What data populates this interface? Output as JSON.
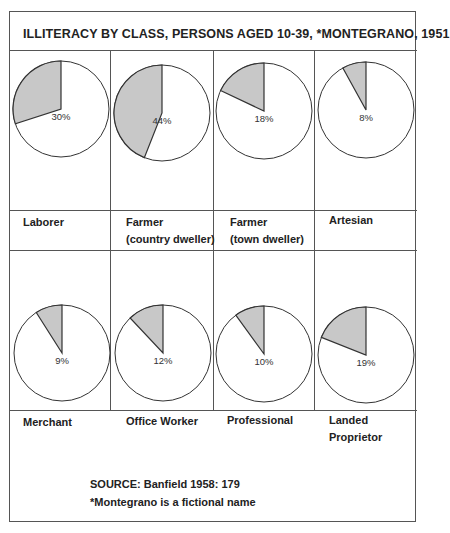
{
  "title": "ILLITERACY BY CLASS, PERSONS AGED 10-39, *MONTEGRANO, 1951",
  "colors": {
    "slice": "#c8c8c8",
    "stroke": "#333333",
    "background": "#ffffff"
  },
  "chart_data": {
    "type": "pie",
    "title": "ILLITERACY BY CLASS, PERSONS AGED 10-39, *MONTEGRANO, 1951",
    "note": "Each pie shows the percentage of illiterate persons (shaded) for one class",
    "categories": [
      "Laborer",
      "Farmer (country dweller)",
      "Farmer (town dweller)",
      "Artesian",
      "Merchant",
      "Office Worker",
      "Professional",
      "Landed Proprietor"
    ],
    "values": [
      30,
      44,
      18,
      8,
      9,
      12,
      10,
      19
    ],
    "unit": "%"
  },
  "panels": [
    {
      "label1": "Laborer",
      "label2": "",
      "pct_label": "30%",
      "value": 30
    },
    {
      "label1": "Farmer",
      "label2": "(country dweller)",
      "pct_label": "44%",
      "value": 44
    },
    {
      "label1": "Farmer",
      "label2": "(town dweller)",
      "pct_label": "18%",
      "value": 18
    },
    {
      "label1": "Artesian",
      "label2": "",
      "pct_label": "8%",
      "value": 8
    },
    {
      "label1": "Merchant",
      "label2": "",
      "pct_label": "9%",
      "value": 9
    },
    {
      "label1": "Office Worker",
      "label2": "",
      "pct_label": "12%",
      "value": 12
    },
    {
      "label1": "Professional",
      "label2": "",
      "pct_label": "10%",
      "value": 10
    },
    {
      "label1": "Landed",
      "label2": "Proprietor",
      "pct_label": "19%",
      "value": 19
    }
  ],
  "source": {
    "line1": "SOURCE:  Banfield 1958: 179",
    "line2": "*Montegrano is a fictional name"
  }
}
